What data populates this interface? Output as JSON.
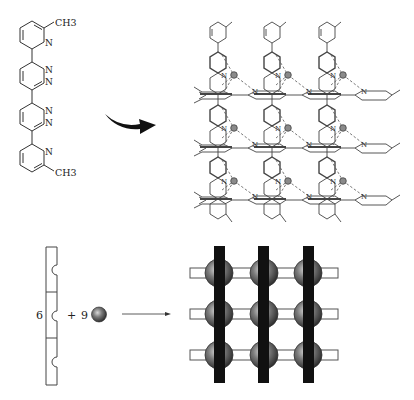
{
  "figure": {
    "type": "chemistry-self-assembly-scheme",
    "ligand": {
      "name": "6,6'''-dimethyl-bis(pyridyl)-bipyridazine",
      "rings_top_to_bottom": [
        "pyridine",
        "pyridazine",
        "pyridazine",
        "pyridine"
      ],
      "labels": {
        "methyl_top": "CH3",
        "methyl_bottom": "CH3",
        "n_atom": "N"
      }
    },
    "top_arrow": {
      "style": "curved-filled",
      "direction": "right"
    },
    "grid_complex": {
      "rows": 3,
      "cols": 3,
      "metal_ions": 9,
      "description": "[3x3] grid formed from six ligands and nine metal ions"
    },
    "equation": {
      "ligand_count": "6",
      "plus": "+",
      "metal_count": "9",
      "arrow": "→"
    },
    "schematic_grid": {
      "rows": 3,
      "cols": 3,
      "vertical_bar_color": "#111111",
      "horizontal_bar_color": "#ffffff",
      "sphere_color": "#555555"
    }
  }
}
